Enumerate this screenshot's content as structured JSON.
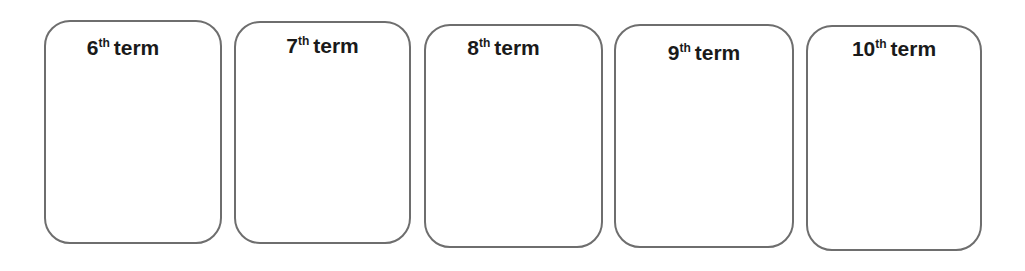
{
  "cards": [
    {
      "number": "6",
      "suffix": "th",
      "word": "term",
      "box": {
        "left": 44,
        "top": 20,
        "width": 178,
        "height": 224
      },
      "label_top": 14,
      "label_offset": -10
    },
    {
      "number": "7",
      "suffix": "th",
      "word": "term",
      "box": {
        "left": 234,
        "top": 21,
        "width": 177,
        "height": 223
      },
      "label_top": 11,
      "label_offset": 0
    },
    {
      "number": "8",
      "suffix": "th",
      "word": "term",
      "box": {
        "left": 424,
        "top": 24,
        "width": 179,
        "height": 224
      },
      "label_top": 10,
      "label_offset": -10
    },
    {
      "number": "9",
      "suffix": "th",
      "word": "term",
      "box": {
        "left": 614,
        "top": 24,
        "width": 180,
        "height": 224
      },
      "label_top": 15,
      "label_offset": 0
    },
    {
      "number": "10",
      "suffix": "th",
      "word": "term",
      "box": {
        "left": 806,
        "top": 25,
        "width": 176,
        "height": 226
      },
      "label_top": 10,
      "label_offset": 0
    }
  ],
  "colors": {
    "border": "#6e6e6e",
    "text": "#1a1a1a",
    "background": "#ffffff"
  }
}
